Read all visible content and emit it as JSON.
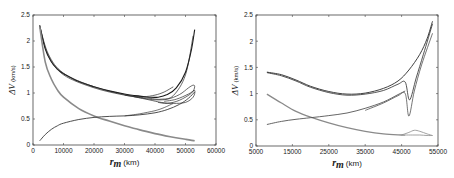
{
  "chart_data": [
    {
      "type": "line",
      "title": "",
      "xlabel": "r_m (km)",
      "xlabel_symbol": "r",
      "xlabel_sub": "m",
      "xlabel_unit": "(km)",
      "ylabel": "ΔV (km/s)",
      "ylabel_symbol": "ΔV",
      "ylabel_unit": "(km/s)",
      "xlim": [
        0,
        60000
      ],
      "ylim": [
        0,
        2.5
      ],
      "xticks": [
        0,
        10000,
        20000,
        30000,
        40000,
        50000,
        60000
      ],
      "xtick_labels": [
        "0",
        "10000",
        "20000",
        "30000",
        "40000",
        "50000",
        "60000"
      ],
      "yticks": [
        0,
        0.5,
        1,
        1.5,
        2,
        2.5
      ],
      "ytick_labels": [
        "0",
        "0.5",
        "1",
        "1.5",
        "2",
        "2.5"
      ],
      "grid": false,
      "legend": null,
      "series": [
        {
          "name": "total ΔV (black bundle)",
          "color": "#1a1a1a",
          "width": 1.1,
          "x": [
            2200,
            4000,
            6000,
            8000,
            10000,
            15000,
            20000,
            25000,
            30000,
            35000,
            38000,
            41000,
            44000,
            47000,
            50000,
            52000,
            53000
          ],
          "y": [
            2.3,
            1.85,
            1.6,
            1.46,
            1.37,
            1.22,
            1.12,
            1.04,
            0.98,
            0.94,
            0.92,
            0.92,
            0.97,
            1.1,
            1.4,
            1.85,
            2.22
          ]
        },
        {
          "name": "total ΔV branch a",
          "color": "#2a2a2a",
          "width": 0.7,
          "x": [
            2200,
            5000,
            10000,
            20000,
            30000,
            38000,
            42000,
            46000,
            50000,
            52500
          ],
          "y": [
            2.28,
            1.72,
            1.35,
            1.1,
            0.96,
            0.9,
            0.88,
            0.95,
            1.35,
            2.1
          ]
        },
        {
          "name": "total ΔV branch b",
          "color": "#2a2a2a",
          "width": 0.7,
          "x": [
            2200,
            5000,
            10000,
            20000,
            30000,
            36000,
            40000,
            43000,
            46000
          ],
          "y": [
            2.3,
            1.75,
            1.38,
            1.12,
            0.97,
            0.93,
            0.96,
            1.02,
            1.12
          ]
        },
        {
          "name": "total ΔV loop",
          "color": "#2a2a2a",
          "width": 0.7,
          "x": [
            30000,
            36000,
            40000,
            44000,
            48000,
            51000,
            52500,
            53000,
            52000,
            48000,
            44000,
            41000
          ],
          "y": [
            0.96,
            0.9,
            0.87,
            0.88,
            0.97,
            1.1,
            1.15,
            1.12,
            1.0,
            0.86,
            0.8,
            0.82
          ]
        },
        {
          "name": "total ΔV loop 2",
          "color": "#2a2a2a",
          "width": 0.7,
          "x": [
            33000,
            38000,
            42000,
            46000,
            50000,
            52500,
            53000,
            51000,
            47000,
            43000
          ],
          "y": [
            0.93,
            0.87,
            0.82,
            0.8,
            0.82,
            0.92,
            1.05,
            0.98,
            0.88,
            0.84
          ]
        },
        {
          "name": "ΔV component (gray, decreasing)",
          "color": "#8a8a8a",
          "width": 1.6,
          "x": [
            2200,
            4000,
            6000,
            8000,
            10000,
            15000,
            20000,
            25000,
            30000,
            35000,
            40000,
            45000,
            50000,
            53000
          ],
          "y": [
            2.28,
            1.6,
            1.27,
            1.06,
            0.92,
            0.7,
            0.56,
            0.46,
            0.37,
            0.29,
            0.22,
            0.16,
            0.11,
            0.08
          ]
        },
        {
          "name": "ΔV component (dark, increasing)",
          "color": "#3a3a3a",
          "width": 0.9,
          "x": [
            2200,
            4000,
            6000,
            8000,
            10000,
            15000,
            20000,
            25000,
            30000,
            35000,
            40000,
            44000,
            48000,
            51000,
            53000
          ],
          "y": [
            0.08,
            0.2,
            0.3,
            0.37,
            0.42,
            0.49,
            0.53,
            0.55,
            0.56,
            0.58,
            0.62,
            0.68,
            0.78,
            0.9,
            1.02
          ]
        },
        {
          "name": "ΔV component (dark, increasing b)",
          "color": "#3a3a3a",
          "width": 0.7,
          "x": [
            30000,
            35000,
            40000,
            43000,
            46000
          ],
          "y": [
            0.56,
            0.6,
            0.66,
            0.72,
            0.8
          ]
        }
      ]
    },
    {
      "type": "line",
      "title": "",
      "xlabel": "r_m (km)",
      "xlabel_symbol": "r",
      "xlabel_sub": "m",
      "xlabel_unit": "(km)",
      "ylabel": "ΔV (km/s)",
      "ylabel_symbol": "ΔV",
      "ylabel_unit": "(km/s)",
      "xlim": [
        5000,
        55000
      ],
      "ylim": [
        0,
        2.5
      ],
      "xticks": [
        5000,
        15000,
        25000,
        35000,
        45000,
        55000
      ],
      "xtick_labels": [
        "5000",
        "15000",
        "25000",
        "35000",
        "45000",
        "55000"
      ],
      "yticks": [
        0,
        0.5,
        1,
        1.5,
        2,
        2.5
      ],
      "ytick_labels": [
        "0",
        "0.5",
        "1",
        "1.5",
        "2",
        "2.5"
      ],
      "grid": false,
      "legend": null,
      "series": [
        {
          "name": "total ΔV upper",
          "color": "#2a2a2a",
          "width": 0.9,
          "x": [
            8000,
            12000,
            16000,
            20000,
            25000,
            30000,
            35000,
            40000,
            44000,
            47000,
            50000,
            52000,
            53500
          ],
          "y": [
            1.41,
            1.36,
            1.26,
            1.14,
            1.04,
            0.99,
            1.01,
            1.1,
            1.24,
            1.45,
            1.75,
            2.05,
            2.38
          ]
        },
        {
          "name": "total ΔV lower",
          "color": "#2a2a2a",
          "width": 0.8,
          "x": [
            8000,
            12000,
            16000,
            20000,
            25000,
            30000,
            35000,
            40000,
            44000,
            46000,
            47200,
            49000,
            51000,
            53500
          ],
          "y": [
            1.4,
            1.34,
            1.24,
            1.12,
            1.02,
            0.97,
            0.99,
            1.06,
            1.18,
            1.22,
            0.88,
            1.3,
            1.75,
            2.33
          ]
        },
        {
          "name": "total ΔV dip",
          "color": "#3a3a3a",
          "width": 0.7,
          "x": [
            35000,
            40000,
            44000,
            46000,
            47000,
            48500,
            50500,
            53500
          ],
          "y": [
            0.68,
            0.82,
            0.96,
            1.0,
            0.57,
            1.05,
            1.55,
            2.15
          ]
        },
        {
          "name": "ΔV component (gray, decreasing)",
          "color": "#8a8a8a",
          "width": 1.3,
          "x": [
            8000,
            12000,
            16000,
            20000,
            25000,
            30000,
            35000,
            40000,
            45000,
            46000
          ],
          "y": [
            0.99,
            0.82,
            0.66,
            0.55,
            0.44,
            0.35,
            0.28,
            0.23,
            0.21,
            0.21
          ]
        },
        {
          "name": "ΔV component (gray, tail)",
          "color": "#8a8a8a",
          "width": 0.8,
          "x": [
            45000,
            47000,
            48500,
            50000,
            52000,
            53500
          ],
          "y": [
            0.21,
            0.26,
            0.3,
            0.28,
            0.23,
            0.2
          ]
        },
        {
          "name": "ΔV component (gray, tail low)",
          "color": "#8a8a8a",
          "width": 0.8,
          "x": [
            46000,
            48000,
            50000,
            52000,
            53500
          ],
          "y": [
            0.21,
            0.21,
            0.21,
            0.2,
            0.2
          ]
        },
        {
          "name": "ΔV component (increasing)",
          "color": "#555555",
          "width": 0.9,
          "x": [
            8000,
            12000,
            16000,
            20000,
            25000,
            30000,
            35000,
            40000,
            44000,
            46000
          ],
          "y": [
            0.41,
            0.47,
            0.51,
            0.54,
            0.58,
            0.63,
            0.72,
            0.84,
            0.98,
            1.05
          ]
        }
      ]
    }
  ],
  "panels": [
    {
      "frame": {
        "left": 33,
        "right": 216,
        "top": 15,
        "bottom": 145
      }
    },
    {
      "frame": {
        "left": 256,
        "right": 438,
        "top": 15,
        "bottom": 146
      }
    }
  ]
}
